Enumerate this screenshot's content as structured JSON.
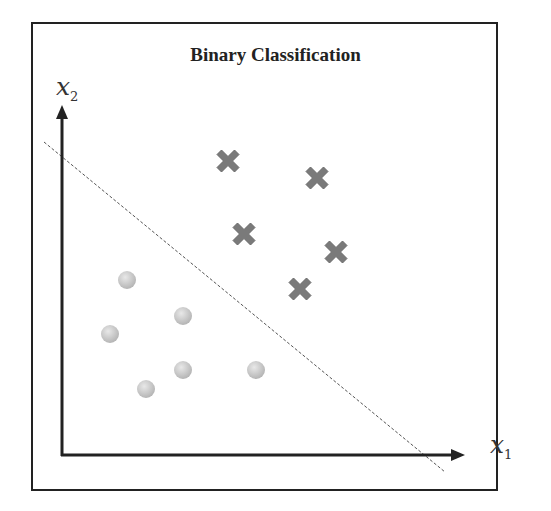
{
  "title": "Binary Classification",
  "axes": {
    "x_label": "x",
    "x_sub": "1",
    "y_label": "x",
    "y_sub": "2"
  },
  "colors": {
    "cross": "#7a7a7a",
    "circle": "#c8c8c8",
    "axis": "#222222",
    "boundary": "#555555"
  },
  "chart_data": {
    "type": "scatter",
    "title": "Binary Classification",
    "xlabel": "x1",
    "ylabel": "x2",
    "grid": false,
    "series": [
      {
        "name": "class-cross",
        "marker": "x",
        "points": [
          [
            228,
            161
          ],
          [
            317,
            178
          ],
          [
            244,
            234
          ],
          [
            336,
            252
          ],
          [
            300,
            289
          ]
        ]
      },
      {
        "name": "class-circle",
        "marker": "o",
        "points": [
          [
            127,
            280
          ],
          [
            183,
            316
          ],
          [
            110,
            334
          ],
          [
            183,
            370
          ],
          [
            256,
            370
          ],
          [
            146,
            389
          ]
        ]
      }
    ],
    "decision_boundary": {
      "style": "dashed",
      "from": [
        44,
        142
      ],
      "to": [
        445,
        472
      ]
    }
  }
}
